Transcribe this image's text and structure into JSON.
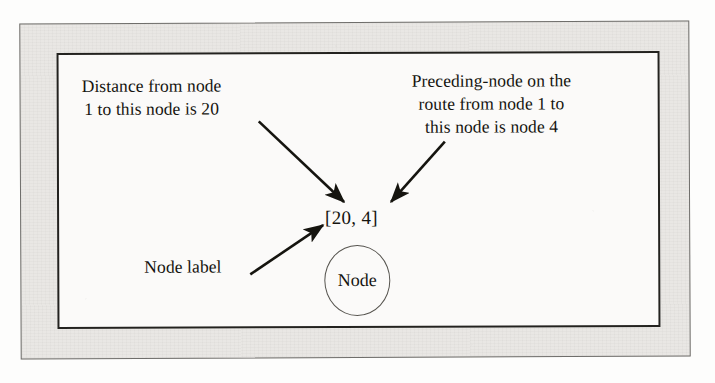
{
  "figure": {
    "caption_absent": true,
    "annotations": {
      "distance": {
        "name": "distance-annotation",
        "lines": [
          "Distance from node",
          "1 to this node is 20"
        ]
      },
      "preceding": {
        "name": "preceding-node-annotation",
        "lines": [
          "Preceding-node on the",
          "route from node 1 to",
          "this node is node 4"
        ]
      },
      "node_label": {
        "name": "node-label-annotation",
        "lines": [
          "Node label"
        ]
      }
    },
    "node": {
      "label_value": "[20, 4]",
      "shape_text": "Node",
      "distance_value": 20,
      "preceding_node": 4,
      "source_node": 1
    },
    "colors": {
      "ink": "#15140f",
      "frame_border": "#6f6e6b",
      "box_border": "#23221f",
      "paper": "#e9e7e4",
      "inner_paper": "#fbfaf9",
      "node_outline": "#56544f"
    },
    "arrows": [
      {
        "name": "arrow-distance-to-label",
        "from": "distance-annotation",
        "to": "node-label-value",
        "direction": "down-right"
      },
      {
        "name": "arrow-preceding-to-label",
        "from": "preceding-node-annotation",
        "to": "node-label-value",
        "direction": "down-left"
      },
      {
        "name": "arrow-nodelabel-to-label",
        "from": "node-label-annotation",
        "to": "node-label-value",
        "direction": "up-right"
      }
    ]
  }
}
